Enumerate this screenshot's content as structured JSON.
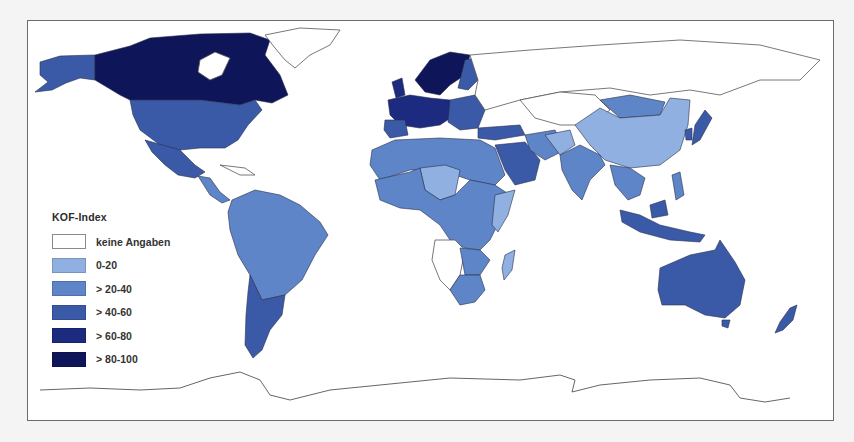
{
  "legend": {
    "title": "KOF-Index",
    "items": [
      {
        "label": "keine Angaben",
        "color": "#ffffff"
      },
      {
        "label": "0-20",
        "color": "#8fb0e0"
      },
      {
        "label": "> 20-40",
        "color": "#5d85c8"
      },
      {
        "label": "> 40-60",
        "color": "#3a5aa8"
      },
      {
        "label": "> 60-80",
        "color": "#1c2a7f"
      },
      {
        "label": "> 80-100",
        "color": "#0e1558"
      }
    ]
  },
  "map": {
    "type": "choropleth world map",
    "regions": [
      {
        "name": "Canada",
        "class": "> 80-100"
      },
      {
        "name": "Alaska / USA",
        "class": "> 40-60"
      },
      {
        "name": "USA",
        "class": "> 40-60"
      },
      {
        "name": "Mexico",
        "class": "> 40-60"
      },
      {
        "name": "Central America",
        "class": "> 20-40"
      },
      {
        "name": "South America (north/Brazil)",
        "class": "> 20-40"
      },
      {
        "name": "Argentina / Chile",
        "class": "> 40-60"
      },
      {
        "name": "Greenland",
        "class": "keine Angaben"
      },
      {
        "name": "Scandinavia",
        "class": "> 80-100"
      },
      {
        "name": "Western Europe",
        "class": "> 60-80"
      },
      {
        "name": "Eastern Europe",
        "class": "> 40-60"
      },
      {
        "name": "Russia",
        "class": "keine Angaben"
      },
      {
        "name": "North Africa",
        "class": "> 20-40"
      },
      {
        "name": "Sahel (Niger/Chad)",
        "class": "0-20"
      },
      {
        "name": "Central/West Africa",
        "class": "> 20-40"
      },
      {
        "name": "Angola/Namibia/Zambia",
        "class": "keine Angaben"
      },
      {
        "name": "South Africa",
        "class": "> 20-40"
      },
      {
        "name": "Madagascar",
        "class": "0-20"
      },
      {
        "name": "Saudi Arabia",
        "class": "> 40-60"
      },
      {
        "name": "Central Asia",
        "class": "keine Angaben"
      },
      {
        "name": "China",
        "class": "0-20"
      },
      {
        "name": "Mongolia",
        "class": "> 20-40"
      },
      {
        "name": "India",
        "class": "> 20-40"
      },
      {
        "name": "Japan",
        "class": "> 40-60"
      },
      {
        "name": "Southeast Asia",
        "class": "> 20-40"
      },
      {
        "name": "Malaysia",
        "class": "> 40-60"
      },
      {
        "name": "Australia",
        "class": "> 40-60"
      },
      {
        "name": "New Zealand",
        "class": "> 40-60"
      },
      {
        "name": "Antarctica",
        "class": "keine Angaben"
      }
    ]
  }
}
